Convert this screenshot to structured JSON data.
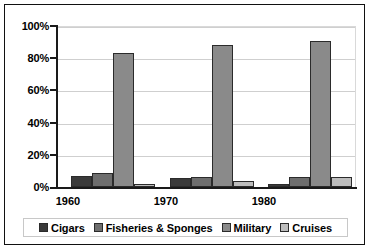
{
  "chart_data": {
    "type": "bar",
    "title": "",
    "subtitle": "",
    "xlabel": "",
    "ylabel": "",
    "categories": [
      "1960",
      "1970",
      "1980"
    ],
    "series": [
      {
        "name": "Cigars",
        "color": "#3a3a3a",
        "values": [
          7,
          5.5,
          2
        ]
      },
      {
        "name": "Fisheries & Sponges",
        "color": "#6e6e6e",
        "values": [
          8.5,
          6,
          6.5
        ]
      },
      {
        "name": "Military",
        "color": "#8a8a8a",
        "values": [
          83,
          88.5,
          91
        ]
      },
      {
        "name": "Cruises",
        "color": "#bdbdbd",
        "values": [
          2,
          4,
          6.5
        ]
      }
    ],
    "ylim": [
      0,
      100
    ],
    "ytick_labels": [
      "100%",
      "80%",
      "60%",
      "40%",
      "20%",
      "0%"
    ],
    "ytick_values": [
      100,
      80,
      60,
      40,
      20,
      0
    ],
    "grid": true,
    "legend_position": "bottom",
    "value_format": "percent"
  },
  "legend": {
    "items": [
      {
        "label": "Cigars"
      },
      {
        "label": "Fisheries & Sponges"
      },
      {
        "label": "Military"
      },
      {
        "label": "Cruises"
      }
    ]
  }
}
